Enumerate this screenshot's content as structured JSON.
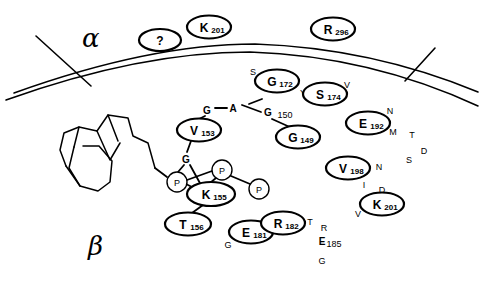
{
  "figure": {
    "background_color": "#ffffff",
    "ink_color": "#000000",
    "width": 484,
    "height": 281
  },
  "domain_labels": {
    "alpha": "α",
    "beta": "β"
  },
  "circled_residues": [
    {
      "id": "unknown",
      "letter": "?",
      "number": "",
      "cx": 160,
      "cy": 40,
      "rx": 21,
      "ry": 11
    },
    {
      "id": "k201-top",
      "letter": "K",
      "number": "201",
      "cx": 209,
      "cy": 27,
      "rx": 22,
      "ry": 11.5
    },
    {
      "id": "r296",
      "letter": "R",
      "number": "296",
      "cx": 333,
      "cy": 29,
      "rx": 22,
      "ry": 11.5
    },
    {
      "id": "g172",
      "letter": "G",
      "number": "172",
      "cx": 277,
      "cy": 81,
      "rx": 22,
      "ry": 11.5
    },
    {
      "id": "s174",
      "letter": "S",
      "number": "174",
      "cx": 325,
      "cy": 94,
      "rx": 22,
      "ry": 11.5
    },
    {
      "id": "v153",
      "letter": "V",
      "number": "153",
      "cx": 199,
      "cy": 130,
      "rx": 22,
      "ry": 11.5
    },
    {
      "id": "g149",
      "letter": "G",
      "number": "149",
      "cx": 298,
      "cy": 137,
      "rx": 22,
      "ry": 11.5
    },
    {
      "id": "e192",
      "letter": "E",
      "number": "192",
      "cx": 368,
      "cy": 123,
      "rx": 22,
      "ry": 11.5
    },
    {
      "id": "v198",
      "letter": "V",
      "number": "198",
      "cx": 348,
      "cy": 168,
      "rx": 22,
      "ry": 11.5
    },
    {
      "id": "k201-right",
      "letter": "K",
      "number": "201",
      "cx": 382,
      "cy": 204,
      "rx": 22,
      "ry": 11.5
    },
    {
      "id": "k155",
      "letter": "K",
      "number": "155",
      "cx": 211,
      "cy": 194,
      "rx": 24,
      "ry": 12
    },
    {
      "id": "t156",
      "letter": "T",
      "number": "156",
      "cx": 188,
      "cy": 224,
      "rx": 23,
      "ry": 11.5
    },
    {
      "id": "e181",
      "letter": "E",
      "number": "181",
      "cx": 251,
      "cy": 232,
      "rx": 22,
      "ry": 11.5
    },
    {
      "id": "r182",
      "letter": "R",
      "number": "182",
      "cx": 283,
      "cy": 223,
      "rx": 22,
      "ry": 11.5
    }
  ],
  "phosphate_circles": [
    {
      "id": "p-left",
      "label": "P",
      "cx": 177,
      "cy": 182,
      "r": 10
    },
    {
      "id": "p-top",
      "label": "P",
      "cx": 222,
      "cy": 170,
      "r": 10
    },
    {
      "id": "p-right",
      "label": "P",
      "cx": 259,
      "cy": 189,
      "r": 10
    }
  ],
  "bold_letters": [
    {
      "id": "g-top-left",
      "label": "G",
      "x": 207,
      "y": 110
    },
    {
      "id": "a-top",
      "label": "A",
      "x": 233,
      "y": 108
    },
    {
      "id": "g150",
      "label": "G",
      "x": 268,
      "y": 112
    },
    {
      "id": "g-mid",
      "label": "G",
      "x": 186,
      "y": 159
    },
    {
      "id": "e185",
      "label": "E",
      "x": 322,
      "y": 241
    }
  ],
  "bold_letter_subscripts": [
    {
      "id": "g150-num",
      "label": "150",
      "x": 285,
      "y": 115
    },
    {
      "id": "e185-num",
      "label": "185",
      "x": 334,
      "y": 244
    }
  ],
  "sequence_letters": [
    {
      "id": "seq-s-172",
      "label": "S",
      "x": 253,
      "y": 72
    },
    {
      "id": "seq-y-173",
      "label": "Y",
      "x": 303,
      "y": 93
    },
    {
      "id": "seq-v-175",
      "label": "V",
      "x": 347,
      "y": 85
    },
    {
      "id": "seq-n-193",
      "label": "N",
      "x": 390,
      "y": 111
    },
    {
      "id": "seq-m-194",
      "label": "M",
      "x": 393,
      "y": 132
    },
    {
      "id": "seq-t-195",
      "label": "T",
      "x": 412,
      "y": 135
    },
    {
      "id": "seq-d-196",
      "label": "D",
      "x": 424,
      "y": 151
    },
    {
      "id": "seq-s-197",
      "label": "S",
      "x": 409,
      "y": 160
    },
    {
      "id": "seq-n-199",
      "label": "N",
      "x": 379,
      "y": 167
    },
    {
      "id": "seq-i-199b",
      "label": "I",
      "x": 364,
      "y": 185
    },
    {
      "id": "seq-d-200",
      "label": "D",
      "x": 382,
      "y": 190
    },
    {
      "id": "seq-v-202",
      "label": "V",
      "x": 358,
      "y": 214
    },
    {
      "id": "seq-g-180",
      "label": "G",
      "x": 228,
      "y": 245
    },
    {
      "id": "seq-t-183",
      "label": "T",
      "x": 310,
      "y": 222
    },
    {
      "id": "seq-r-184",
      "label": "R",
      "x": 324,
      "y": 228
    },
    {
      "id": "seq-g-186",
      "label": "G",
      "x": 322,
      "y": 261
    }
  ],
  "membrane": {
    "main_curve": "M 6,100 Q 140,52 250,52 Q 370,56 478,106",
    "upper_curve": "M 14,93 Q 150,44 255,44 Q 372,48 478,92",
    "left_branch": "M 36,36 L 91,86",
    "right_branch": "M 435,48 L 405,81"
  },
  "bonds": [
    {
      "id": "bond-g-a",
      "d": "M 215,108 L 227,108"
    },
    {
      "id": "bond-a-g150",
      "d": "M 242,105 L 261,112"
    },
    {
      "id": "bond-g-v153",
      "d": "M 205,116 L 199,119"
    },
    {
      "id": "bond-v153-g",
      "d": "M 191,141 L 187,152"
    },
    {
      "id": "bond-g150-g149",
      "d": "M 272,119 L 292,128"
    },
    {
      "id": "bond-a-left",
      "d": "M 249,104 L 262,99"
    },
    {
      "id": "bond-g-p-left",
      "d": "M 184,165 L 178,172"
    },
    {
      "id": "bond-g-k155",
      "d": "M 190,165 L 201,185"
    },
    {
      "id": "bond-p-left-k155",
      "d": "M 186,184 L 196,189"
    },
    {
      "id": "bond-p-top-k155",
      "d": "M 216,178 L 210,183"
    },
    {
      "id": "bond-p-top-p-right",
      "d": "M 231,176 L 250,184"
    },
    {
      "id": "bond-p-left-p-top",
      "d": "M 187,180 L 212,171"
    },
    {
      "id": "bond-k155-t156",
      "d": "M 203,205 L 192,213"
    },
    {
      "id": "bond-chain-p",
      "d": "M 167,177 L 155,168"
    }
  ],
  "lipid_chain": {
    "tail": "M 155,168 L 148,143 L 133,136 L 128,118 L 108,115 L 97,131 L 79,127 L 74,147",
    "ring_inner": "M 79,127 L 64,133 L 60,150 L 66,166",
    "ring_body": "M 74,147 L 69,168 L 80,186 L 98,191 L 110,182 L 112,161 L 99,146 L 83,146",
    "ring_extra": "M 66,166 L 80,186",
    "fold": "M 97,131 L 110,160 L 120,143",
    "fold2": "M 108,115 L 118,141"
  }
}
